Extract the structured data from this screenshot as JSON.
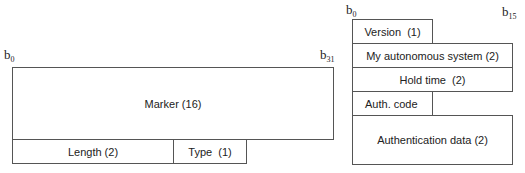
{
  "left_diagram": {
    "bit_start": {
      "base": "b",
      "sub": "0"
    },
    "bit_end": {
      "base": "b",
      "sub": "31"
    },
    "fields": {
      "marker": "Marker (16)",
      "length": "Length (2)",
      "type": "Type  (1)"
    }
  },
  "right_diagram": {
    "bit_start": {
      "base": "b",
      "sub": "0"
    },
    "bit_end": {
      "base": "b",
      "sub": "15"
    },
    "fields": {
      "version": "Version  (1)",
      "my_as": "My autonomous system (2)",
      "hold_time": "Hold time  (2)",
      "auth_code": "Auth. code",
      "auth_data": "Authentication data (2)"
    }
  }
}
